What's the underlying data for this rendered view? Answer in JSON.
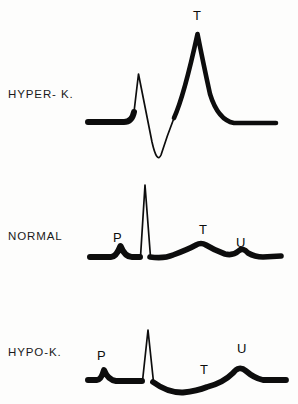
{
  "figure": {
    "background_color": "#fdfdfc",
    "ink_color": "#0d0d0d",
    "width": 298,
    "height": 404
  },
  "rows": [
    {
      "id": "hyper-k",
      "label": "HYPER- K.",
      "label_top": 88,
      "baseline_y": 122,
      "wave_labels": [
        {
          "text": "T",
          "x": 193,
          "y": 8
        }
      ]
    },
    {
      "id": "normal",
      "label": "NORMAL",
      "label_top": 230,
      "baseline_y": 256,
      "wave_labels": [
        {
          "text": "P",
          "x": 113,
          "y": 230
        },
        {
          "text": "T",
          "x": 199,
          "y": 222
        },
        {
          "text": "U",
          "x": 236,
          "y": 235
        }
      ]
    },
    {
      "id": "hypo-k",
      "label": "HYPO-K.",
      "label_top": 346,
      "baseline_y": 382,
      "wave_labels": [
        {
          "text": "P",
          "x": 97,
          "y": 348
        },
        {
          "text": "T",
          "x": 200,
          "y": 362
        },
        {
          "text": "U",
          "x": 237,
          "y": 341
        }
      ]
    }
  ],
  "chart_data": {
    "type": "line",
    "title": "",
    "subtitle": "",
    "xlabel": "",
    "ylabel": "",
    "grid": false,
    "legend_position": "left-row-labels",
    "series": [
      {
        "name": "HYPER- K.",
        "baseline_y": 122,
        "stroke_widths": {
          "flat": 6,
          "qrs": 1.6,
          "t": 4.5
        },
        "features": [
          {
            "wave": "baseline-start",
            "x": 88,
            "y": 122
          },
          {
            "wave": "R",
            "x": 138,
            "y": 74,
            "label": null
          },
          {
            "wave": "S",
            "x": 158,
            "y": 161,
            "label": null
          },
          {
            "wave": "T",
            "x": 198,
            "y": 33,
            "label": "T",
            "note": "tall peaked tented T wave"
          },
          {
            "wave": "baseline-end",
            "x": 276,
            "y": 122
          }
        ],
        "path": "M 88 122 L 122 122 Q 131 122 133 110 L 138 74 L 152 140 Q 157 163 160 156 Q 168 130 178 108 L 198 33 L 210 92 Q 219 121 234 123 L 276 123"
      },
      {
        "name": "NORMAL",
        "baseline_y": 256,
        "stroke_widths": {
          "flat": 6,
          "qrs": 1.6,
          "t": 5
        },
        "features": [
          {
            "wave": "P",
            "x": 120,
            "y": 245,
            "label": "P"
          },
          {
            "wave": "R",
            "x": 145,
            "y": 185,
            "label": null
          },
          {
            "wave": "T",
            "x": 204,
            "y": 243,
            "label": "T"
          },
          {
            "wave": "U",
            "x": 241,
            "y": 251,
            "label": "U"
          },
          {
            "wave": "baseline-start",
            "x": 90,
            "y": 257
          },
          {
            "wave": "baseline-end",
            "x": 280,
            "y": 256
          }
        ],
        "path": "M 90 257 L 110 257 Q 116 257 120 247 Q 124 257 131 257 L 139 257 L 145 185 L 150 257 Q 163 258 172 254 Q 190 248 196 244 Q 201 242 206 244 Q 214 249 224 253 Q 233 255 238 251 Q 243 248 248 253 Q 254 257 262 257 L 280 256"
      },
      {
        "name": "HYPO-K.",
        "baseline_y": 382,
        "stroke_widths": {
          "flat": 6,
          "qrs": 1.6,
          "t": 5
        },
        "features": [
          {
            "wave": "P",
            "x": 104,
            "y": 369,
            "label": "P"
          },
          {
            "wave": "R",
            "x": 148,
            "y": 330,
            "label": null
          },
          {
            "wave": "T",
            "x": 207,
            "y": 380,
            "label": "T",
            "note": "flattened / depressed T wave"
          },
          {
            "wave": "U",
            "x": 243,
            "y": 368,
            "label": "U",
            "note": "prominent U wave"
          },
          {
            "wave": "baseline-start",
            "x": 88,
            "y": 380
          },
          {
            "wave": "baseline-end",
            "x": 285,
            "y": 380
          }
        ],
        "path": "M 88 380 L 96 380 Q 101 380 104 371 Q 108 380 116 381 L 141 381 L 148 330 L 154 383 Q 168 392 182 392 Q 196 391 206 387 Q 222 383 232 374 Q 239 366 246 371 Q 253 377 262 380 L 285 380"
      }
    ]
  }
}
